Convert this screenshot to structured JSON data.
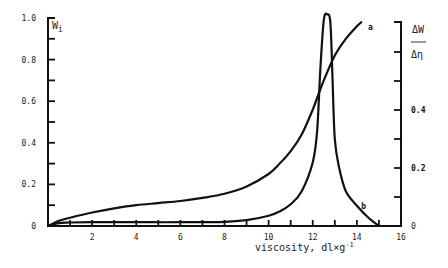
{
  "chart_data": {
    "type": "line",
    "title": "",
    "xlabel": "viscosity,  dl×g⁻¹",
    "ylabel_left": "W_i",
    "ylabel_right": "ΔW / Δη",
    "xlim": [
      0,
      16
    ],
    "ylim_left": [
      0,
      1.0
    ],
    "ylim_right": [
      0,
      0.7
    ],
    "x_ticks": [
      2,
      4,
      6,
      8,
      10,
      12,
      14,
      16
    ],
    "x_tick_labels": [
      "2",
      "4",
      "6",
      "8",
      "10",
      "12",
      "14",
      "16"
    ],
    "x_minor_ticks": [
      1,
      3,
      5,
      7,
      9,
      11,
      13,
      15
    ],
    "y_left_ticks": [
      0,
      0.2,
      0.4,
      0.6,
      0.8,
      1.0
    ],
    "y_left_tick_labels": [
      "0",
      "0.2",
      "0.4",
      "0.6",
      "0.8",
      "1.0"
    ],
    "y_left_minor_ticks": [
      0.1,
      0.3,
      0.5,
      0.7,
      0.9
    ],
    "y_right_ticks": [
      0,
      0.2,
      0.4
    ],
    "y_right_tick_labels": [
      "0",
      "0.2",
      "0.4"
    ],
    "y_right_minor_ticks": [
      0.1,
      0.3,
      0.5,
      0.6
    ],
    "grid": false,
    "legend": "none",
    "series": [
      {
        "name": "a",
        "axis": "left",
        "description": "cumulative weight fraction W_i",
        "x": [
          0,
          0.5,
          1,
          2,
          3,
          4,
          5,
          6,
          7,
          8,
          9,
          10,
          10.5,
          11,
          11.5,
          12,
          12.5,
          13,
          13.5,
          14,
          14.2
        ],
        "y": [
          0,
          0.025,
          0.04,
          0.065,
          0.085,
          0.1,
          0.11,
          0.12,
          0.135,
          0.155,
          0.19,
          0.25,
          0.3,
          0.36,
          0.44,
          0.56,
          0.7,
          0.82,
          0.9,
          0.96,
          0.98
        ]
      },
      {
        "name": "b",
        "axis": "right",
        "description": "differential distribution ΔW/Δη",
        "x": [
          0,
          0.5,
          1,
          2,
          4,
          6,
          8,
          9,
          10,
          10.5,
          11,
          11.5,
          12,
          12.2,
          12.35,
          12.5,
          12.65,
          12.8,
          12.9,
          13.0,
          13.2,
          13.5,
          14,
          14.5,
          15.0
        ],
        "y": [
          0,
          0.01,
          0.012,
          0.013,
          0.013,
          0.013,
          0.014,
          0.02,
          0.035,
          0.05,
          0.075,
          0.12,
          0.22,
          0.33,
          0.55,
          0.71,
          0.73,
          0.7,
          0.5,
          0.3,
          0.2,
          0.12,
          0.07,
          0.03,
          0
        ]
      }
    ],
    "annotations": [
      {
        "text": "a",
        "near": "end of curve a",
        "x": 14.5,
        "y_left": 0.94
      },
      {
        "text": "b",
        "near": "falling tail of curve b",
        "x": 14.2,
        "y_right": 0.06
      }
    ]
  }
}
